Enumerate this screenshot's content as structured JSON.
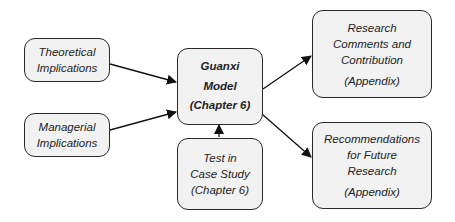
{
  "diagram": {
    "nodes": {
      "theoretical": {
        "lines": [
          "Theoretical",
          "Implications"
        ]
      },
      "managerial": {
        "lines": [
          "Managerial",
          "Implications"
        ]
      },
      "guanxi": {
        "lines": [
          "Guanxi",
          "Model",
          "(Chapter 6)"
        ]
      },
      "case_study": {
        "lines": [
          "Test in",
          "Case Study",
          "(Chapter 6)"
        ]
      },
      "research_comments": {
        "lines": [
          "Research",
          "Comments and",
          "Contribution",
          "(Appendix)"
        ]
      },
      "recommendations": {
        "lines": [
          "Recommendations",
          "for Future",
          "Research",
          "(Appendix)"
        ]
      }
    },
    "edges": [
      {
        "from": "theoretical",
        "to": "guanxi"
      },
      {
        "from": "managerial",
        "to": "guanxi"
      },
      {
        "from": "case_study",
        "to": "guanxi"
      },
      {
        "from": "guanxi",
        "to": "research_comments"
      },
      {
        "from": "guanxi",
        "to": "recommendations"
      }
    ],
    "colors": {
      "box_fill": "#f2f2f2",
      "border": "#2a2a2a",
      "arrow": "#111111"
    }
  }
}
